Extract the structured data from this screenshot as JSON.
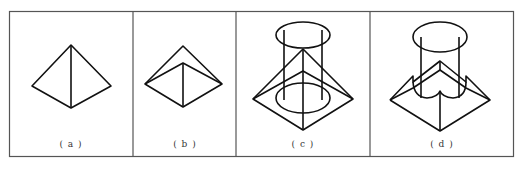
{
  "figure": {
    "panels": [
      {
        "id": "a",
        "label": "( a )",
        "description": "square pyramid"
      },
      {
        "id": "b",
        "label": "( b )",
        "description": "square pyramid with inner ridge"
      },
      {
        "id": "c",
        "label": "( c )",
        "description": "pyramid intersected by vertical cylinder"
      },
      {
        "id": "d",
        "label": "( d )",
        "description": "pyramid with cylindrical cut-out"
      }
    ]
  }
}
